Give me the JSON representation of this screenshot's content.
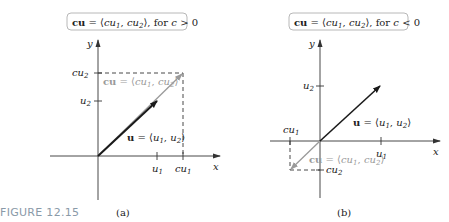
{
  "figure": {
    "caption": "FIGURE 12.15",
    "panels": [
      {
        "id": "a",
        "panel_label": "(a)",
        "title": {
          "lhs": "cu",
          "eq": " = ⟨",
          "c1": "cu",
          "s1": "1",
          "comma": ", ",
          "c2": "cu",
          "s2": "2",
          "rest": "⟩, for ",
          "cond_var": "c",
          "cond": " > 0"
        },
        "axis_x": "x",
        "axis_y": "y",
        "ticks_x": [
          {
            "base": "u",
            "sub": "1"
          },
          {
            "base": "cu",
            "sub": "1"
          }
        ],
        "ticks_y": [
          {
            "base": "u",
            "sub": "2"
          },
          {
            "base": "cu",
            "sub": "2"
          }
        ],
        "vector_u_label": {
          "bold": "u",
          "eq": " = ⟨",
          "a": "u",
          "as": "1",
          "comma": ", ",
          "b": "u",
          "bs": "2",
          "end": "⟩"
        },
        "vector_cu_label": {
          "bold": "cu",
          "eq": " = ⟨",
          "a": "cu",
          "as": "1",
          "comma": ", ",
          "b": "cu",
          "bs": "2",
          "end": "⟩"
        }
      },
      {
        "id": "b",
        "panel_label": "(b)",
        "title": {
          "lhs": "cu",
          "eq": " = ⟨",
          "c1": "cu",
          "s1": "1",
          "comma": ", ",
          "c2": "cu",
          "s2": "2",
          "rest": "⟩, for ",
          "cond_var": "c",
          "cond": " < 0"
        },
        "axis_x": "x",
        "axis_y": "y",
        "ticks_x": [
          {
            "base": "u",
            "sub": "1"
          },
          {
            "base": "cu",
            "sub": "1"
          }
        ],
        "ticks_y": [
          {
            "base": "u",
            "sub": "2"
          },
          {
            "base": "cu",
            "sub": "2"
          }
        ],
        "vector_u_label": {
          "bold": "u",
          "eq": " = ⟨",
          "a": "u",
          "as": "1",
          "comma": ", ",
          "b": "u",
          "bs": "2",
          "end": "⟩"
        },
        "vector_cu_label": {
          "bold": "cu",
          "eq": " = ⟨",
          "a": "cu",
          "as": "1",
          "comma": ", ",
          "b": "cu",
          "bs": "2",
          "end": "⟩"
        }
      }
    ]
  },
  "colors": {
    "axis": "#333333",
    "vector_u": "#1a1a1a",
    "vector_cu": "#9a9a9a",
    "dashed": "#333333",
    "caption": "#8a9aa8"
  }
}
